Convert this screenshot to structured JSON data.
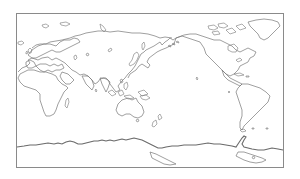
{
  "map": {
    "type": "world-outline",
    "projection": "equirectangular",
    "central_meridian": "Pacific-centered",
    "style": {
      "background": "#ffffff",
      "coastline_color": "#777777",
      "frame_color": "#8a8a8a"
    },
    "regions": [
      "Europe",
      "Asia",
      "Africa",
      "Australia",
      "New Zealand",
      "North America",
      "South America",
      "Greenland",
      "Antarctica"
    ]
  }
}
